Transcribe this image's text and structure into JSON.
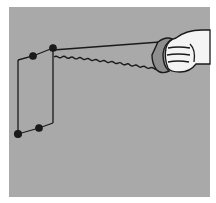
{
  "illustration": {
    "subject": "hand holding a saw cutting a thin rectangular panel",
    "colors": {
      "background": "#ffffff",
      "panel": "#a9a9a9",
      "ink": "#1a1a1a",
      "hand": "#f4f4f4"
    },
    "icons": [
      "saw-icon",
      "hand-icon",
      "work-panel-icon"
    ]
  }
}
